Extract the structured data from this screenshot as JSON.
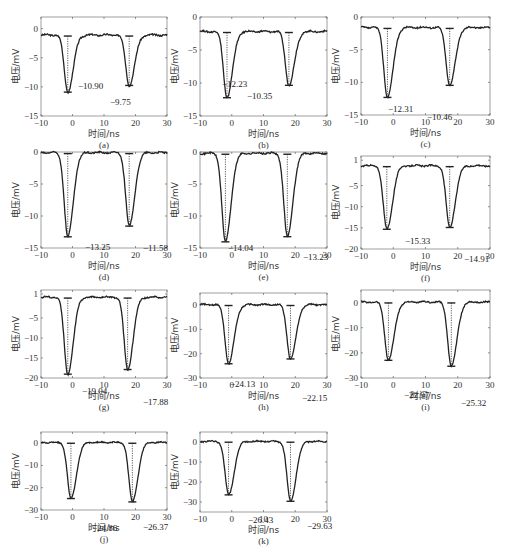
{
  "figure": {
    "xlabel": "时间/ns",
    "ylabel": "电压/mV"
  },
  "chart_data": [
    {
      "type": "line",
      "panel": "(a)",
      "xlabel": "时间/ns",
      "ylabel": "电压/mV",
      "xlim": [
        -10,
        30
      ],
      "ylim": [
        -15,
        2
      ],
      "xticks": [
        -10,
        0,
        10,
        20,
        30
      ],
      "yticks": [
        0,
        -5,
        -10,
        -15
      ],
      "baseline": -1.1,
      "peaks": [
        {
          "t": -1.5,
          "value": -10.9
        },
        {
          "t": 18,
          "value": -9.75
        }
      ],
      "annotations": [
        "-10.90",
        "-9.75"
      ]
    },
    {
      "type": "line",
      "panel": "(b)",
      "xlabel": "时间/ns",
      "ylabel": "电压/mV",
      "xlim": [
        -10,
        30
      ],
      "ylim": [
        -15,
        0
      ],
      "xticks": [
        -10,
        0,
        10,
        20,
        30
      ],
      "yticks": [
        0,
        -5,
        -10,
        -15
      ],
      "baseline": -2.2,
      "peaks": [
        {
          "t": -1.5,
          "value": -12.23
        },
        {
          "t": 18,
          "value": -10.35
        }
      ],
      "annotations": [
        "-12.23",
        "-10.35"
      ]
    },
    {
      "type": "line",
      "panel": "(c)",
      "xlabel": "时间/ns",
      "ylabel": "电压/mV",
      "xlim": [
        -10,
        30
      ],
      "ylim": [
        -15,
        0
      ],
      "xticks": [
        -10,
        0,
        10,
        20,
        30
      ],
      "yticks": [
        0,
        -5,
        -10,
        -15
      ],
      "baseline": -1.6,
      "peaks": [
        {
          "t": -1.8,
          "value": -12.31
        },
        {
          "t": 17.5,
          "value": -10.46
        }
      ],
      "annotations": [
        "-12.31",
        "-10.46"
      ]
    },
    {
      "type": "line",
      "panel": "(d)",
      "xlabel": "时间/ns",
      "ylabel": "电压/mV",
      "xlim": [
        -10,
        30
      ],
      "ylim": [
        -15,
        0
      ],
      "xticks": [
        -10,
        0,
        10,
        20,
        30
      ],
      "yticks": [
        0,
        -5,
        -10,
        -15
      ],
      "baseline": -0.1,
      "peaks": [
        {
          "t": -1.5,
          "value": -13.25
        },
        {
          "t": 18,
          "value": -11.58
        }
      ],
      "annotations": [
        "-13.25",
        "-11.58"
      ]
    },
    {
      "type": "line",
      "panel": "(e)",
      "xlabel": "时间/ns",
      "ylabel": "电压/mV",
      "xlim": [
        -10,
        30
      ],
      "ylim": [
        -15,
        0
      ],
      "xticks": [
        -10,
        0,
        10,
        20,
        30
      ],
      "yticks": [
        0,
        -5,
        -10,
        -15
      ],
      "baseline": -0.2,
      "peaks": [
        {
          "t": -2,
          "value": -14.04
        },
        {
          "t": 17.5,
          "value": -13.23
        }
      ],
      "annotations": [
        "-14.04",
        "-13.23"
      ]
    },
    {
      "type": "line",
      "panel": "(f)",
      "xlabel": "时间/ns",
      "ylabel": "电压/mV",
      "xlim": [
        -10,
        30
      ],
      "ylim": [
        -20,
        2
      ],
      "xticks": [
        -10,
        0,
        10,
        20,
        30
      ],
      "yticks": [
        1,
        -5,
        -10,
        -15,
        -20
      ],
      "baseline": -0.3,
      "peaks": [
        {
          "t": -2,
          "value": -15.33
        },
        {
          "t": 17.5,
          "value": -14.91
        }
      ],
      "annotations": [
        "-15.33",
        "-14.91"
      ]
    },
    {
      "type": "line",
      "panel": "(g)",
      "xlabel": "时间/ns",
      "ylabel": "电压/mV",
      "xlim": [
        -10,
        30
      ],
      "ylim": [
        -20,
        2
      ],
      "xticks": [
        -10,
        0,
        10,
        20,
        30
      ],
      "yticks": [
        1,
        -5,
        -10,
        -15,
        -20
      ],
      "baseline": 0.2,
      "peaks": [
        {
          "t": -1.5,
          "value": -19.04
        },
        {
          "t": 17.5,
          "value": -17.88
        }
      ],
      "annotations": [
        "-19.04",
        "-17.88"
      ]
    },
    {
      "type": "line",
      "panel": "(h)",
      "xlabel": "时间/ns",
      "ylabel": "电压/mV",
      "xlim": [
        -10,
        30
      ],
      "ylim": [
        -30,
        5
      ],
      "xticks": [
        -10,
        0,
        10,
        20,
        30
      ],
      "yticks": [
        0,
        -10,
        -20,
        -30
      ],
      "baseline": 0.2,
      "peaks": [
        {
          "t": -1,
          "value": -24.13
        },
        {
          "t": 18.5,
          "value": -22.15
        }
      ],
      "annotations": [
        "-24.13",
        "-22.15"
      ]
    },
    {
      "type": "line",
      "panel": "(i)",
      "xlabel": "时间/ns",
      "ylabel": "电压/mV",
      "xlim": [
        -10,
        30
      ],
      "ylim": [
        -30,
        5
      ],
      "xticks": [
        -10,
        0,
        10,
        20,
        30
      ],
      "yticks": [
        0,
        -10,
        -20,
        -30
      ],
      "baseline": 0.2,
      "peaks": [
        {
          "t": -1.5,
          "value": -22.97
        },
        {
          "t": 18,
          "value": -25.32
        }
      ],
      "annotations": [
        "-22.97",
        "-25.32"
      ]
    },
    {
      "type": "line",
      "panel": "(j)",
      "xlabel": "时间/ns",
      "ylabel": "电压/mV",
      "xlim": [
        -10,
        30
      ],
      "ylim": [
        -30,
        5
      ],
      "xticks": [
        -10,
        0,
        10,
        20,
        30
      ],
      "yticks": [
        0,
        -10,
        -20,
        -30
      ],
      "baseline": 0.3,
      "peaks": [
        {
          "t": -0.5,
          "value": -24.86
        },
        {
          "t": 19,
          "value": -26.37
        }
      ],
      "annotations": [
        "-24.86",
        "-26.37"
      ]
    },
    {
      "type": "line",
      "panel": "(k)",
      "xlabel": "时间/ns",
      "ylabel": "电压/mV",
      "xlim": [
        -10,
        30
      ],
      "ylim": [
        -35,
        5
      ],
      "xticks": [
        -10,
        0,
        10,
        20,
        30
      ],
      "yticks": [
        0,
        -10,
        -20,
        -30
      ],
      "baseline": 0.3,
      "peaks": [
        {
          "t": -1,
          "value": -26.43
        },
        {
          "t": 18.5,
          "value": -29.63
        }
      ],
      "annotations": [
        "-26.43",
        "-29.63"
      ]
    }
  ],
  "layout": [
    {
      "x": 41,
      "y": 17,
      "w": 126,
      "h": 99,
      "ann": [
        [
          78,
          72
        ],
        [
          110,
          88
        ]
      ]
    },
    {
      "x": 200,
      "y": 17,
      "w": 127,
      "h": 99,
      "ann": [
        [
          222,
          70
        ],
        [
          247,
          82
        ]
      ]
    },
    {
      "x": 361,
      "y": 17,
      "w": 129,
      "h": 98,
      "ann": [
        [
          388,
          95
        ],
        [
          427,
          103
        ]
      ]
    },
    {
      "x": 41,
      "y": 152,
      "w": 126,
      "h": 96,
      "ann": [
        [
          85,
          98
        ],
        [
          143,
          99
        ]
      ]
    },
    {
      "x": 200,
      "y": 152,
      "w": 127,
      "h": 96,
      "ann": [
        [
          228,
          99
        ],
        [
          303,
          108
        ]
      ]
    },
    {
      "x": 361,
      "y": 156,
      "w": 129,
      "h": 93,
      "ann": [
        [
          405,
          88
        ],
        [
          464,
          106
        ]
      ]
    },
    {
      "x": 41,
      "y": 290,
      "w": 126,
      "h": 88,
      "ann": [
        [
          82,
          104
        ],
        [
          143,
          115
        ]
      ]
    },
    {
      "x": 200,
      "y": 293,
      "w": 127,
      "h": 85,
      "ann": [
        [
          230,
          94
        ],
        [
          302,
          108
        ]
      ]
    },
    {
      "x": 361,
      "y": 290,
      "w": 129,
      "h": 88,
      "ann": [
        [
          404,
          108
        ],
        [
          461,
          116
        ]
      ]
    },
    {
      "x": 41,
      "y": 432,
      "w": 126,
      "h": 78,
      "ann": [
        [
          92,
          99
        ],
        [
          143,
          98
        ]
      ]
    },
    {
      "x": 200,
      "y": 432,
      "w": 127,
      "h": 80,
      "ann": [
        [
          248,
          91
        ],
        [
          307,
          97
        ]
      ]
    }
  ]
}
